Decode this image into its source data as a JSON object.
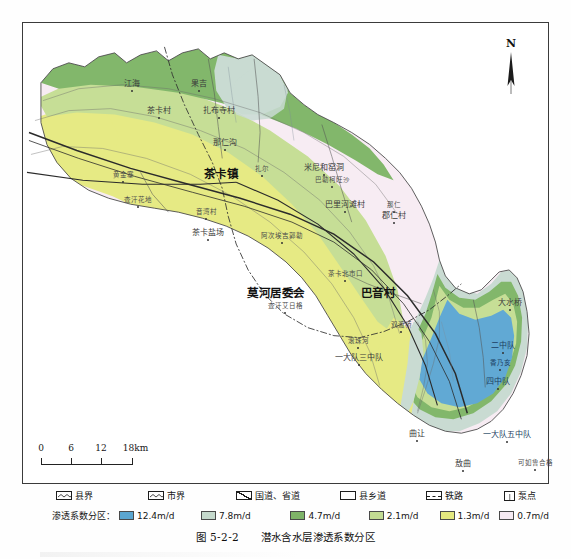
{
  "figure": {
    "number": "图 5-2-2",
    "title": "潜水含水层渗透系数分区"
  },
  "map": {
    "north_arrow_label": "N",
    "scale": {
      "unit_label": "18km",
      "ticks": [
        "0",
        "6",
        "12",
        "18km"
      ],
      "tick_values": [
        0,
        6,
        12,
        18
      ]
    },
    "labels": [
      {
        "text": "茶卡镇",
        "x": 198,
        "y": 152,
        "cls": "town"
      },
      {
        "text": "莫河居委会",
        "x": 253,
        "y": 271,
        "cls": "town"
      },
      {
        "text": "巴音村",
        "x": 355,
        "y": 271,
        "cls": "town"
      },
      {
        "text": "茶卡盐场",
        "x": 185,
        "y": 210,
        "cls": "vill"
      },
      {
        "text": "茶卡村",
        "x": 136,
        "y": 88,
        "cls": "vill"
      },
      {
        "text": "江海",
        "x": 109,
        "y": 61,
        "cls": "vill"
      },
      {
        "text": "果吉",
        "x": 176,
        "y": 61,
        "cls": "vill"
      },
      {
        "text": "扎布寺村",
        "x": 196,
        "y": 88,
        "cls": "vill"
      },
      {
        "text": "那仁沟",
        "x": 202,
        "y": 120,
        "cls": "vill"
      },
      {
        "text": "扎尔",
        "x": 239,
        "y": 146,
        "cls": "vsm"
      },
      {
        "text": "米尼和窑洞",
        "x": 301,
        "y": 145,
        "cls": "vill"
      },
      {
        "text": "巴勒柯旺沙",
        "x": 309,
        "y": 157,
        "cls": "vsm"
      },
      {
        "text": "巴里河滩村",
        "x": 322,
        "y": 182,
        "cls": "vill"
      },
      {
        "text": "郡仁村",
        "x": 371,
        "y": 193,
        "cls": "vill"
      },
      {
        "text": "那仁",
        "x": 371,
        "y": 182,
        "cls": "vsm"
      },
      {
        "text": "黄金寨",
        "x": 100,
        "y": 152,
        "cls": "vsm"
      },
      {
        "text": "查汗花地",
        "x": 115,
        "y": 177,
        "cls": "vsm"
      },
      {
        "text": "音湾村",
        "x": 183,
        "y": 189,
        "cls": "vsm"
      },
      {
        "text": "阿次埃吉郭勒",
        "x": 259,
        "y": 213,
        "cls": "vsm"
      },
      {
        "text": "茶卡北市口",
        "x": 322,
        "y": 251,
        "cls": "vsm"
      },
      {
        "text": "查汗艾日格",
        "x": 262,
        "y": 283,
        "cls": "vsm"
      },
      {
        "text": "双渡桥",
        "x": 378,
        "y": 302,
        "cls": "vsm"
      },
      {
        "text": "滚珠河",
        "x": 335,
        "y": 318,
        "cls": "vsm"
      },
      {
        "text": "一大队三中队",
        "x": 336,
        "y": 335,
        "cls": "vill"
      },
      {
        "text": "大水桥",
        "x": 487,
        "y": 280,
        "cls": "vill"
      },
      {
        "text": "二中队",
        "x": 480,
        "y": 323,
        "cls": "vill blue"
      },
      {
        "text": "香乃亥",
        "x": 477,
        "y": 340,
        "cls": "vsm blue"
      },
      {
        "text": "四中队",
        "x": 475,
        "y": 359,
        "cls": "vill blue"
      },
      {
        "text": "一大队五中队",
        "x": 484,
        "y": 412,
        "cls": "vill blue"
      },
      {
        "text": "可如鲁合格",
        "x": 512,
        "y": 440,
        "cls": "vsm"
      },
      {
        "text": "曲让",
        "x": 394,
        "y": 411,
        "cls": "vill"
      },
      {
        "text": "敖曲",
        "x": 440,
        "y": 441,
        "cls": "vill"
      }
    ]
  },
  "legend": {
    "symbols": [
      {
        "name": "county-boundary",
        "label": "县界",
        "kind": "zigzag"
      },
      {
        "name": "city-boundary",
        "label": "市界",
        "kind": "zigzag"
      },
      {
        "name": "national-road",
        "label": "国道、省道",
        "kind": "diagonal"
      },
      {
        "name": "county-road",
        "label": "县乡道",
        "kind": "plain"
      },
      {
        "name": "railway",
        "label": "铁路",
        "kind": "dash"
      },
      {
        "name": "pumping-point",
        "label": "泵点",
        "kind": "pump"
      }
    ],
    "zone_label": "渗透系数分区：",
    "zones": [
      {
        "value": "12.4m/d",
        "color": "#5ba6d0"
      },
      {
        "value": "7.8m/d",
        "color": "#c5d9cc"
      },
      {
        "value": "4.7m/d",
        "color": "#7fb468"
      },
      {
        "value": "2.1m/d",
        "color": "#c3dc93"
      },
      {
        "value": "1.3m/d",
        "color": "#e4e87f"
      },
      {
        "value": "0.7m/d",
        "color": "#f6eaf2"
      }
    ]
  }
}
